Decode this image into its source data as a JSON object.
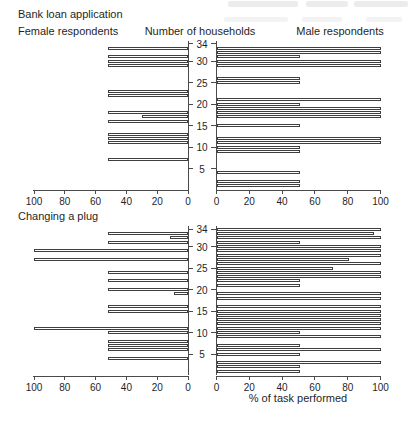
{
  "page": {
    "artifact_color_1": "#ececec",
    "artifact_color_2": "#f3f3f3"
  },
  "header": {
    "left": "Female respondents",
    "center": "Number of households",
    "right": "Male respondents"
  },
  "chart_data": {
    "type": "bar",
    "subtype": "back-to-back horizontal bars (population-pyramid style), one row per household",
    "xlabel": "% of task performed",
    "center_axis_label": "Number of households",
    "left_series_label": "Female respondents",
    "right_series_label": "Male respondents",
    "x_ticks_left": [
      100,
      80,
      60,
      40,
      20,
      0
    ],
    "x_ticks_right": [
      0,
      20,
      40,
      60,
      80,
      100
    ],
    "y_ticks": [
      5,
      10,
      15,
      20,
      25,
      30,
      34
    ],
    "y_max": 34,
    "x_range": [
      0,
      100
    ],
    "grid": false,
    "legend_position": "none",
    "bar_color": "#3f3f3f",
    "charts": [
      {
        "title": "Bank loan application",
        "female": [
          [
            33,
            52
          ],
          [
            31,
            52
          ],
          [
            30,
            52
          ],
          [
            29,
            52
          ],
          [
            23,
            52
          ],
          [
            22,
            52
          ],
          [
            18,
            52
          ],
          [
            17,
            30
          ],
          [
            16,
            52
          ],
          [
            13,
            52
          ],
          [
            12,
            52
          ],
          [
            11,
            52
          ],
          [
            7,
            52
          ]
        ],
        "male": [
          [
            33,
            100
          ],
          [
            32,
            100
          ],
          [
            31,
            51
          ],
          [
            30,
            100
          ],
          [
            29,
            100
          ],
          [
            26,
            51
          ],
          [
            25,
            51
          ],
          [
            21,
            100
          ],
          [
            20,
            51
          ],
          [
            19,
            100
          ],
          [
            18,
            100
          ],
          [
            17,
            100
          ],
          [
            15,
            51
          ],
          [
            12,
            100
          ],
          [
            11,
            100
          ],
          [
            10,
            51
          ],
          [
            9,
            51
          ],
          [
            4,
            51
          ],
          [
            2,
            51
          ],
          [
            1,
            51
          ]
        ]
      },
      {
        "title": "Changing a plug",
        "female": [
          [
            33,
            52
          ],
          [
            32,
            12
          ],
          [
            31,
            52
          ],
          [
            29,
            100
          ],
          [
            27,
            100
          ],
          [
            24,
            52
          ],
          [
            22,
            52
          ],
          [
            20,
            52
          ],
          [
            19,
            9
          ],
          [
            16,
            52
          ],
          [
            15,
            52
          ],
          [
            11,
            100
          ],
          [
            10,
            52
          ],
          [
            8,
            52
          ],
          [
            7,
            52
          ],
          [
            6,
            52
          ],
          [
            4,
            52
          ]
        ],
        "male": [
          [
            34,
            100
          ],
          [
            33,
            96
          ],
          [
            32,
            100
          ],
          [
            31,
            51
          ],
          [
            30,
            100
          ],
          [
            29,
            100
          ],
          [
            28,
            100
          ],
          [
            27,
            81
          ],
          [
            26,
            100
          ],
          [
            25,
            71
          ],
          [
            24,
            100
          ],
          [
            23,
            100
          ],
          [
            22,
            51
          ],
          [
            21,
            51
          ],
          [
            19,
            100
          ],
          [
            18,
            100
          ],
          [
            16,
            100
          ],
          [
            15,
            100
          ],
          [
            14,
            100
          ],
          [
            13,
            100
          ],
          [
            12,
            100
          ],
          [
            11,
            100
          ],
          [
            10,
            51
          ],
          [
            9,
            100
          ],
          [
            7,
            51
          ],
          [
            6,
            100
          ],
          [
            5,
            51
          ],
          [
            3,
            100
          ],
          [
            2,
            51
          ],
          [
            1,
            51
          ]
        ]
      }
    ]
  }
}
